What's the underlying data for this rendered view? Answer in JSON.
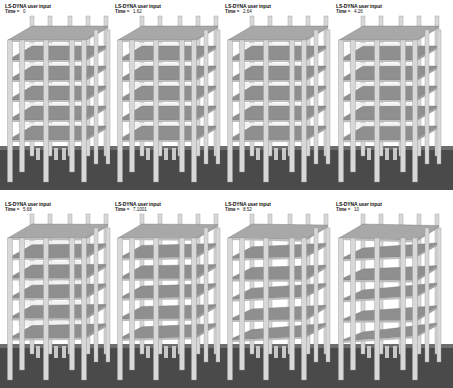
{
  "figure": {
    "frames": [
      {
        "title": "LS-DYNA user input",
        "time_label": "Time =",
        "time_value": "0",
        "collapse": 0
      },
      {
        "title": "LS-DYNA user input",
        "time_label": "Time =",
        "time_value": "1.62",
        "collapse": 0
      },
      {
        "title": "LS-DYNA user input",
        "time_label": "Time =",
        "time_value": "2.64",
        "collapse": 0
      },
      {
        "title": "LS-DYNA user input",
        "time_label": "Time =",
        "time_value": "4.26",
        "collapse": 0.05
      },
      {
        "title": "LS-DYNA user input",
        "time_label": "Time =",
        "time_value": "5.68",
        "collapse": 0.2
      },
      {
        "title": "LS-DYNA user input",
        "time_label": "Time =",
        "time_value": "7.1001",
        "collapse": 0.35
      },
      {
        "title": "LS-DYNA user input",
        "time_label": "Time =",
        "time_value": "8.52",
        "collapse": 0.7
      },
      {
        "title": "LS-DYNA user input",
        "time_label": "Time =",
        "time_value": "10",
        "collapse": 1
      }
    ],
    "colors": {
      "ground": "#4a4a4a",
      "ground_light": "#6e6e6e",
      "slab": "#8f8f8f",
      "slab_top": "#a8a8a8",
      "column": "#d8d8d8",
      "column_edge": "#9a9a9a",
      "background": "#ffffff"
    }
  }
}
